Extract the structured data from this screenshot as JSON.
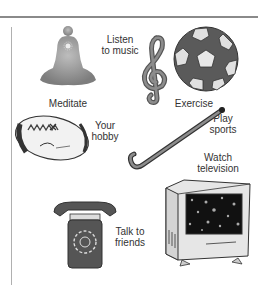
{
  "activities": [
    {
      "id": "meditate",
      "label": "Meditate",
      "icon": "meditation-figure-icon"
    },
    {
      "id": "listen",
      "label": "Listen\nto music",
      "icon": "treble-clef-icon"
    },
    {
      "id": "exercise",
      "label": "Exercise",
      "icon": "soccer-ball-icon"
    },
    {
      "id": "hobby",
      "label": "Your\nhobby",
      "icon": "rugby-ball-icon"
    },
    {
      "id": "sports",
      "label": "Play\nsports",
      "icon": "hockey-stick-icon"
    },
    {
      "id": "tv",
      "label": "Watch\ntelevision",
      "icon": "television-icon"
    },
    {
      "id": "friends",
      "label": "Talk to\nfriends",
      "icon": "telephone-icon"
    }
  ],
  "colors": {
    "ink": "#333333",
    "gray_dark": "#555555",
    "gray_mid": "#8c8c8c",
    "gray_light": "#c8c8c8",
    "rule": "#8a8a8a"
  }
}
